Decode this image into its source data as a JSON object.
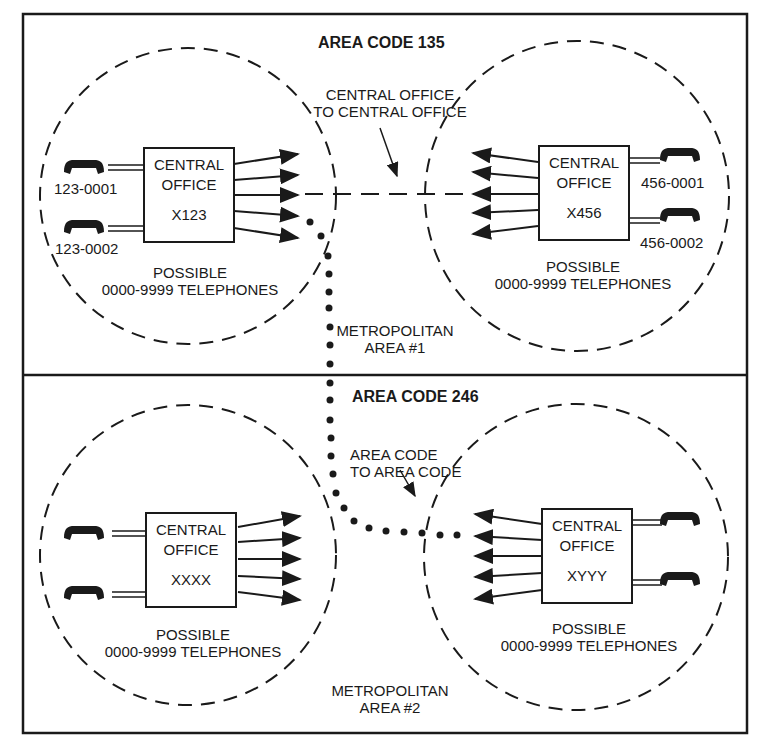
{
  "diagram": {
    "areas": [
      {
        "title": "AREA CODE 135",
        "metro_label_line1": "METROPOLITAN",
        "metro_label_line2": "AREA #1",
        "connection_label_line1": "CENTRAL OFFICE",
        "connection_label_line2": "TO CENTRAL OFFICE",
        "offices": [
          {
            "label_line1": "CENTRAL",
            "label_line2": "OFFICE",
            "code": "X123",
            "phones": [
              "123-0001",
              "123-0002"
            ],
            "possible_line1": "POSSIBLE",
            "possible_line2": "0000-9999 TELEPHONES"
          },
          {
            "label_line1": "CENTRAL",
            "label_line2": "OFFICE",
            "code": "X456",
            "phones": [
              "456-0001",
              "456-0002"
            ],
            "possible_line1": "POSSIBLE",
            "possible_line2": "0000-9999 TELEPHONES"
          }
        ]
      },
      {
        "title": "AREA CODE 246",
        "metro_label_line1": "METROPOLITAN",
        "metro_label_line2": "AREA #2",
        "connection_label_line1": "AREA CODE",
        "connection_label_line2": "TO AREA CODE",
        "offices": [
          {
            "label_line1": "CENTRAL",
            "label_line2": "OFFICE",
            "code": "XXXX",
            "phones": [],
            "possible_line1": "POSSIBLE",
            "possible_line2": "0000-9999 TELEPHONES"
          },
          {
            "label_line1": "CENTRAL",
            "label_line2": "OFFICE",
            "code": "XYYY",
            "phones": [],
            "possible_line1": "POSSIBLE",
            "possible_line2": "0000-9999 TELEPHONES"
          }
        ]
      }
    ]
  }
}
